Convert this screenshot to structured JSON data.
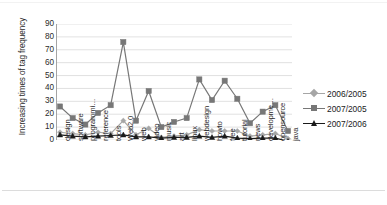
{
  "chart_data": {
    "type": "line",
    "title": "",
    "xlabel": "",
    "ylabel": "Increasing times of tag frequency",
    "ylim": [
      0,
      90
    ],
    "ytick_step": 10,
    "yticks": [
      0,
      10,
      20,
      30,
      40,
      50,
      60,
      70,
      80,
      90
    ],
    "grid": true,
    "legend_position": "right",
    "categories": [
      "design",
      "software",
      "programmi…",
      "reference",
      "tools",
      "Web2.0",
      "web",
      "video",
      "music",
      "art",
      "linux",
      "webdesign",
      "howto",
      "free",
      "tutorial",
      "news",
      "developme…",
      "opensource",
      "java"
    ],
    "series": [
      {
        "name": "2006/2005",
        "color": "#a6a6a6",
        "marker": "diamond",
        "values": [
          6,
          5,
          4,
          6,
          5,
          15,
          4,
          9,
          2,
          3,
          4,
          8,
          7,
          7,
          7,
          3,
          4,
          5,
          1
        ]
      },
      {
        "name": "2007/2005",
        "color": "#777777",
        "marker": "square",
        "values": [
          26,
          17,
          12,
          21,
          27,
          76,
          15,
          38,
          10,
          14,
          17,
          47,
          31,
          46,
          32,
          13,
          22,
          27,
          7
        ]
      },
      {
        "name": "2007/2006",
        "color": "#1a1a1a",
        "marker": "triangle",
        "values": [
          4,
          3,
          2.5,
          3,
          3.5,
          4,
          2.5,
          2.5,
          1.5,
          2,
          2,
          3,
          2,
          3,
          1.5,
          1,
          1.5,
          1.5,
          -1
        ]
      }
    ]
  },
  "axis": {
    "y_title": "Increasing times of tag frequency"
  },
  "legend": {
    "items": [
      {
        "label": "2006/2005"
      },
      {
        "label": "2007/2005"
      },
      {
        "label": "2007/2006"
      }
    ]
  }
}
